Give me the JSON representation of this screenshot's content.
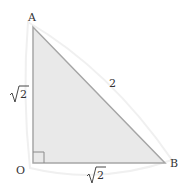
{
  "diagram": {
    "vertices": {
      "A": {
        "label": "A",
        "x": 33,
        "y": 27
      },
      "O": {
        "label": "O",
        "x": 33,
        "y": 163
      },
      "B": {
        "label": "B",
        "x": 165,
        "y": 163
      }
    },
    "sides": {
      "OA": {
        "label": "√2",
        "radicand": "2"
      },
      "OB": {
        "label": "√2",
        "radicand": "2"
      },
      "AB": {
        "label": "2"
      }
    },
    "right_angle_at": "O",
    "colors": {
      "fill": "#e8e8e8",
      "stroke": "#a8a8a8",
      "text": "#333333",
      "halo": "#f2f2f2"
    }
  }
}
